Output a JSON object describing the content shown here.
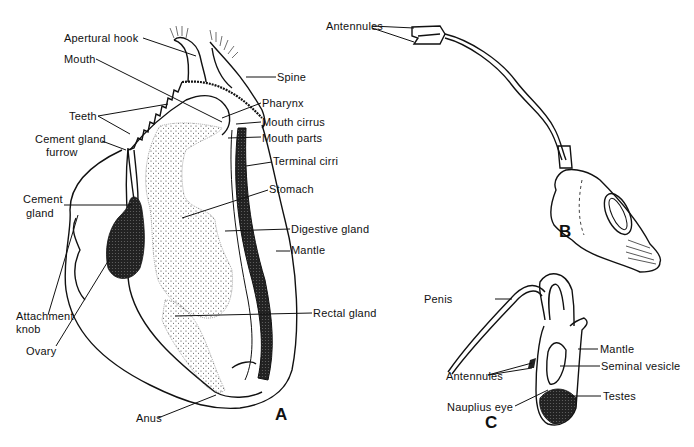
{
  "figure": {
    "panels": [
      {
        "id": "A",
        "letter": "A",
        "labels": {
          "apertural_hook": "Apertural hook",
          "mouth": "Mouth",
          "spine": "Spine",
          "pharynx": "Pharynx",
          "teeth": "Teeth",
          "mouth_cirrus": "Mouth cirrus",
          "mouth_parts": "Mouth parts",
          "cement_gland_furrow_1": "Cement gland",
          "cement_gland_furrow_2": "furrow",
          "terminal_cirri": "Terminal cirri",
          "cement_gland_1": "Cement",
          "cement_gland_2": "gland",
          "stomach": "Stomach",
          "digestive_gland": "Digestive gland",
          "mantle": "Mantle",
          "attachment_knob_1": "Attachment",
          "attachment_knob_2": "knob",
          "rectal_gland": "Rectal gland",
          "ovary": "Ovary",
          "anus": "Anus"
        }
      },
      {
        "id": "B",
        "letter": "B",
        "labels": {
          "antennules": "Antennules"
        }
      },
      {
        "id": "C",
        "letter": "C",
        "labels": {
          "penis": "Penis",
          "mantle": "Mantle",
          "antennules": "Antennules",
          "seminal_vesicle": "Seminal vesicle",
          "nauplius_eye": "Nauplius eye",
          "testes": "Testes"
        }
      }
    ]
  }
}
